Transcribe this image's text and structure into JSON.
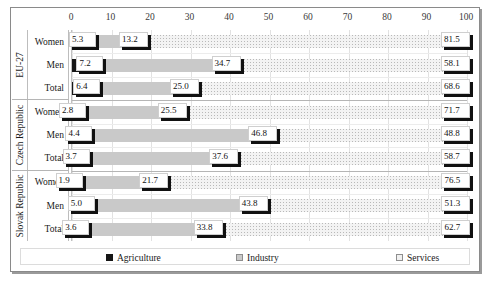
{
  "chart_data": {
    "type": "bar",
    "orientation": "horizontal",
    "stacked": true,
    "title": "",
    "xlabel": "",
    "ylabel": "",
    "xlim": [
      0,
      100
    ],
    "xticks": [
      0,
      10,
      20,
      30,
      40,
      50,
      60,
      70,
      80,
      90,
      100
    ],
    "grid": true,
    "legend_position": "bottom",
    "series": [
      {
        "name": "Agriculture",
        "color": "#161616",
        "values": [
          5.3,
          7.2,
          6.4,
          2.8,
          4.4,
          3.7,
          1.9,
          5.0,
          3.6
        ]
      },
      {
        "name": "Industry",
        "color": "#c9c9c9",
        "values": [
          13.2,
          34.7,
          25.0,
          25.5,
          46.8,
          37.6,
          21.7,
          43.8,
          33.8
        ]
      },
      {
        "name": "Services",
        "color": "#f0f0f0",
        "values": [
          81.5,
          58.1,
          68.6,
          71.7,
          48.8,
          58.7,
          76.5,
          51.3,
          62.7
        ]
      }
    ],
    "groups": [
      {
        "label": "EU-27",
        "categories": [
          "Women",
          "Men",
          "Total"
        ]
      },
      {
        "label": "Czech Republic",
        "categories": [
          "Women",
          "Men",
          "Total"
        ]
      },
      {
        "label": "Slovak Republic",
        "categories": [
          "Women",
          "Men",
          "Total"
        ]
      }
    ],
    "categories": [
      "EU-27 Women",
      "EU-27 Men",
      "EU-27 Total",
      "Czech Republic Women",
      "Czech Republic Men",
      "Czech Republic Total",
      "Slovak Republic Women",
      "Slovak Republic Men",
      "Slovak Republic Total"
    ],
    "rows": [
      {
        "group": "EU-27",
        "category": "Women",
        "agriculture": "5.3",
        "industry": "13.2",
        "services": "81.5"
      },
      {
        "group": "EU-27",
        "category": "Men",
        "agriculture": "7.2",
        "industry": "34.7",
        "services": "58.1"
      },
      {
        "group": "EU-27",
        "category": "Total",
        "agriculture": "6.4",
        "industry": "25.0",
        "services": "68.6"
      },
      {
        "group": "Czech Republic",
        "category": "Women",
        "agriculture": "2.8",
        "industry": "25.5",
        "services": "71.7"
      },
      {
        "group": "Czech Republic",
        "category": "Men",
        "agriculture": "4.4",
        "industry": "46.8",
        "services": "48.8"
      },
      {
        "group": "Czech Republic",
        "category": "Total",
        "agriculture": "3.7",
        "industry": "37.6",
        "services": "58.7"
      },
      {
        "group": "Slovak Republic",
        "category": "Women",
        "agriculture": "1.9",
        "industry": "21.7",
        "services": "76.5"
      },
      {
        "group": "Slovak Republic",
        "category": "Men",
        "agriculture": "5.0",
        "industry": "43.8",
        "services": "51.3"
      },
      {
        "group": "Slovak Republic",
        "category": "Total",
        "agriculture": "3.6",
        "industry": "33.8",
        "services": "62.7"
      }
    ]
  },
  "axis": {
    "ticks": [
      "0",
      "10",
      "20",
      "30",
      "40",
      "50",
      "60",
      "70",
      "80",
      "90",
      "100"
    ]
  },
  "legend": {
    "items": [
      {
        "label": "Agriculture",
        "swatch": "agriculture-swatch"
      },
      {
        "label": "Industry",
        "swatch": "industry-swatch"
      },
      {
        "label": "Services",
        "swatch": "services-swatch"
      }
    ]
  }
}
